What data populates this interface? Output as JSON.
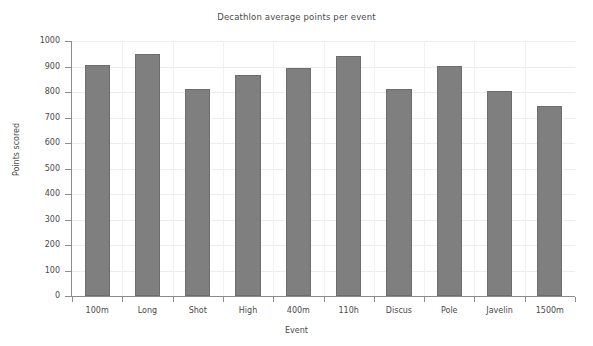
{
  "chart_data": {
    "type": "bar",
    "title": "Decathlon average points per event",
    "xlabel": "Event",
    "ylabel": "Points scored",
    "categories": [
      "100m",
      "Long",
      "Shot",
      "High",
      "400m",
      "110h",
      "Discus",
      "Pole",
      "Javelin",
      "1500m"
    ],
    "values": [
      905,
      950,
      810,
      865,
      895,
      940,
      810,
      903,
      802,
      745
    ],
    "ylim": [
      0,
      1000
    ],
    "ytick_values": [
      0,
      100,
      200,
      300,
      400,
      500,
      600,
      700,
      800,
      900,
      1000
    ],
    "ytick_labels": [
      "0",
      "100",
      "200",
      "300",
      "400",
      "500",
      "600",
      "700",
      "800",
      "900",
      "1000"
    ],
    "grid": true,
    "legend": null,
    "bar_color": "#7f7f7f",
    "bar_edge_color": "#6d6d6d",
    "background_color": "#ffffff",
    "gridline_color": "#ededed",
    "axis_color": "#8c8c8c",
    "text_color": "#4a4a4a"
  }
}
